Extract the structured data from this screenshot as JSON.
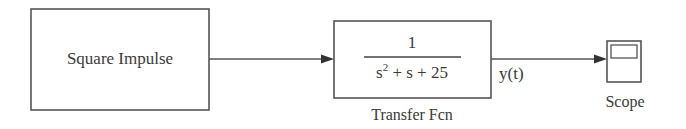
{
  "diagram": {
    "type": "simulink-block-diagram",
    "blocks": [
      {
        "id": "square-impulse",
        "label": "Square Impulse",
        "kind": "subsystem"
      },
      {
        "id": "transfer-fcn",
        "label": "Transfer Fcn",
        "kind": "transfer-function",
        "numerator": "1",
        "denominator": {
          "s2": "s",
          "exp": "2",
          "rest": " + s + 25"
        }
      },
      {
        "id": "scope",
        "label": "Scope",
        "kind": "scope"
      }
    ],
    "signals": [
      {
        "from": "square-impulse",
        "to": "transfer-fcn",
        "label": ""
      },
      {
        "from": "transfer-fcn",
        "to": "scope",
        "label": "y(t)"
      }
    ]
  },
  "colors": {
    "stroke": "#555555",
    "text": "#3a3a3a",
    "background": "#ffffff"
  }
}
